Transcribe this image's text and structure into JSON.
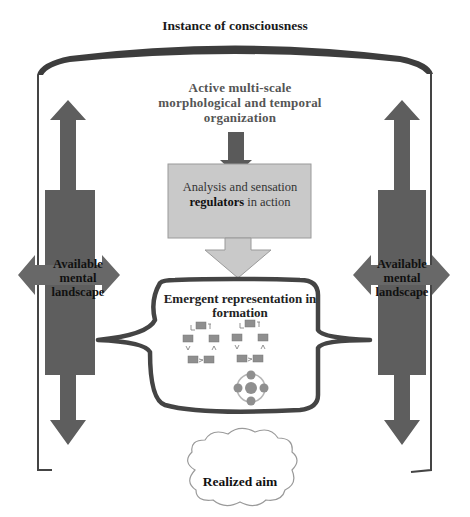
{
  "diagram": {
    "title": "Instance of consciousness",
    "top_process": {
      "label_lines": [
        "Active multi-scale",
        "morphological and temporal",
        "organization"
      ]
    },
    "regulator_box": {
      "line1": "Analysis and sensation",
      "line2_bold": "regulators",
      "line2_rest": " in action"
    },
    "representation": {
      "label_lines": [
        "Emergent representation in",
        "formation"
      ]
    },
    "side_panels": {
      "left": {
        "label_lines": [
          "Available",
          "mental",
          "landscape"
        ]
      },
      "right": {
        "label_lines": [
          "Available",
          "mental",
          "landscape"
        ]
      }
    },
    "outcome": {
      "label": "Realized aim"
    },
    "colors": {
      "dark_arrow": "#5a5a5a",
      "frame": "#444444",
      "regulator_fill": "#c8c8c8",
      "cloud_fill": "#ffffff",
      "node_fill": "#8a8a8a"
    }
  }
}
